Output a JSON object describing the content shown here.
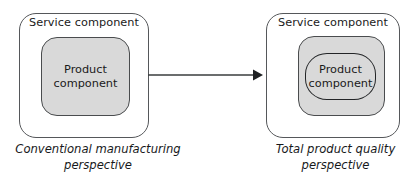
{
  "figure": {
    "type": "diagram",
    "background_color": "#ffffff",
    "fill_color": "#d9d9d9",
    "stroke_color": "#4a4c4e"
  },
  "left_panel": {
    "outer_label": "Service component",
    "product_label_line1": "Product",
    "product_label_line2": "component",
    "caption_line1": "Conventional manufacturing",
    "caption_line2": "perspective"
  },
  "right_panel": {
    "outer_label": "Service component",
    "product_label_line1": "Product",
    "product_label_line2": "component",
    "caption_line1": "Total product quality",
    "caption_line2": "perspective"
  },
  "arrow": {
    "icon": "arrow-right-icon",
    "direction": "left-to-right",
    "color": "#3a3c3e"
  }
}
